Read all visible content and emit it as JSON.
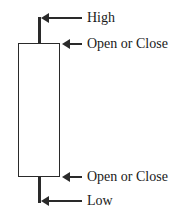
{
  "diagram": {
    "type": "candlestick-anatomy",
    "labels": {
      "high": "High",
      "open_close_top": "Open or Close",
      "open_close_bottom": "Open or Close",
      "low": "Low"
    }
  }
}
